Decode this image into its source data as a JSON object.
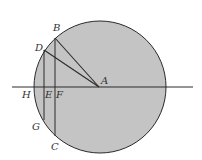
{
  "diagram": {
    "type": "geometry-circle",
    "colors": {
      "fill": "#c4c4c4",
      "stroke": "#2a2a2a",
      "label": "#333333",
      "background": "#ffffff"
    },
    "circle": {
      "cx": 100,
      "cy": 87,
      "r": 66
    },
    "points": {
      "A": {
        "label": "A",
        "x": 99,
        "y": 87
      },
      "B": {
        "label": "B",
        "x": 55,
        "y": 38
      },
      "C": {
        "label": "C",
        "x": 55,
        "y": 136
      },
      "D": {
        "label": "D",
        "x": 44,
        "y": 50
      },
      "E": {
        "label": "E",
        "x": 44,
        "y": 87
      },
      "F": {
        "label": "F",
        "x": 55,
        "y": 87
      },
      "G": {
        "label": "G",
        "x": 44,
        "y": 120
      },
      "H": {
        "label": "H",
        "x": 34,
        "y": 87
      }
    },
    "segments": [
      "AB",
      "AD",
      "BC",
      "DG",
      "horizontal-diameter-line"
    ]
  }
}
